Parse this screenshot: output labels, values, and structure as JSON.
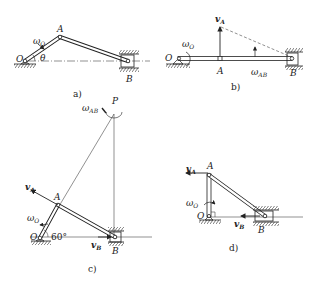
{
  "figure": {
    "panels": [
      {
        "id": "a",
        "caption": "a)",
        "points": {
          "O": "O",
          "A": "A",
          "B": "B"
        },
        "omega_O": "ω",
        "omega_O_sub": "O",
        "angle": "θ"
      },
      {
        "id": "b",
        "caption": "b)",
        "points": {
          "O": "O",
          "A": "A",
          "B": "B"
        },
        "omega_O": "ω",
        "omega_O_sub": "O",
        "vA": "v",
        "vA_sub": "A",
        "omega_AB": "ω",
        "omega_AB_sub": "AB"
      },
      {
        "id": "c",
        "caption": "c)",
        "points": {
          "O": "O",
          "A": "A",
          "B": "B",
          "P": "P"
        },
        "omega_O": "ω",
        "omega_O_sub": "O",
        "vA": "v",
        "vA_sub": "A",
        "vB": "v",
        "vB_sub": "B",
        "omega_AB": "ω",
        "omega_AB_sub": "AB",
        "angle": "60°"
      },
      {
        "id": "d",
        "caption": "d)",
        "points": {
          "O": "O",
          "A": "A",
          "B": "B"
        },
        "omega_O": "ω",
        "omega_O_sub": "O",
        "vA": "v",
        "vA_sub": "A",
        "vB": "v",
        "vB_sub": "B"
      }
    ]
  },
  "colors": {
    "ink": "#222222",
    "background": "#ffffff"
  }
}
